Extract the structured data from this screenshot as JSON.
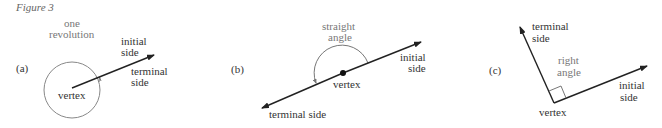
{
  "figure": {
    "title": "Figure 3",
    "panels": [
      {
        "id": "a",
        "label": "(a)",
        "angle_name_line1": "one",
        "angle_name_line2": "revolution",
        "initial_line1": "initial",
        "initial_line2": "side",
        "terminal_line1": "terminal",
        "terminal_line2": "side",
        "vertex": "vertex"
      },
      {
        "id": "b",
        "label": "(b)",
        "angle_name_line1": "straight",
        "angle_name_line2": "angle",
        "initial_line1": "initial",
        "initial_line2": "side",
        "terminal": "terminal side",
        "vertex": "vertex"
      },
      {
        "id": "c",
        "label": "(c)",
        "angle_name_line1": "right",
        "angle_name_line2": "angle",
        "initial_line1": "initial",
        "initial_line2": "side",
        "terminal_line1": "terminal",
        "terminal_line2": "side",
        "vertex": "vertex"
      }
    ]
  },
  "colors": {
    "ink": "#222222",
    "text": "#333333",
    "muted_text": "#777777",
    "stroke_light": "#888888"
  }
}
